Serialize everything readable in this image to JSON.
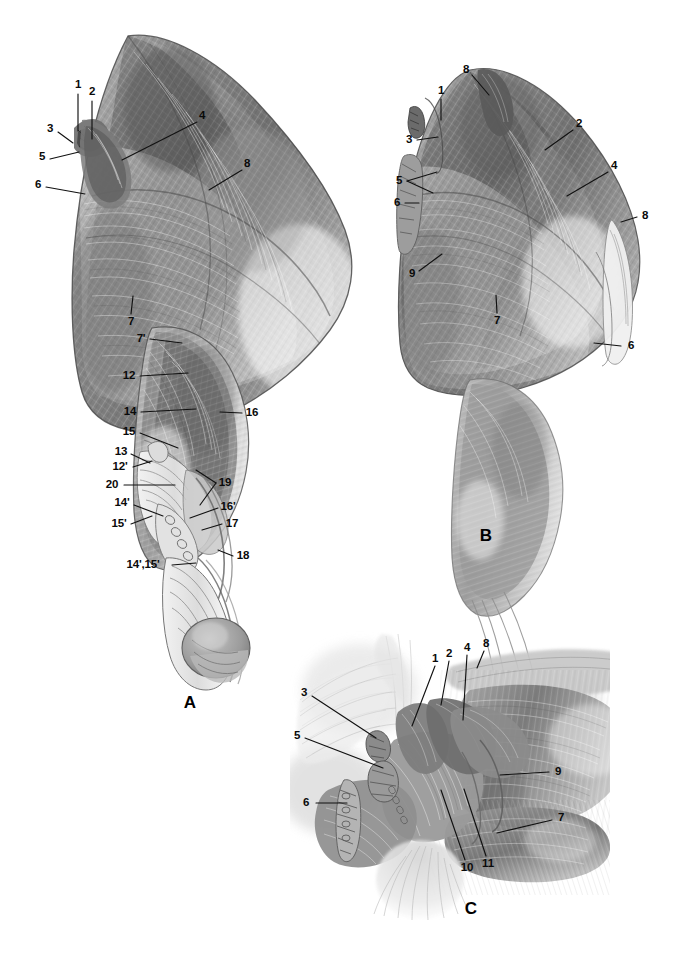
{
  "plate": {
    "background_color": "#ffffff",
    "ink_color": "#0a0a0a",
    "width": 678,
    "height": 963,
    "style": "grayscale pencil anatomical illustration"
  },
  "panels": [
    {
      "id": "A",
      "letter": "A",
      "letter_pos": [
        190,
        703
      ],
      "labels": [
        {
          "text": "1",
          "x": 78,
          "y": 85,
          "lx1": 78,
          "ly1": 94,
          "lx2": 78,
          "ly2": 131
        },
        {
          "text": "2",
          "x": 92,
          "y": 92,
          "lx1": 92,
          "ly1": 101,
          "lx2": 92,
          "ly2": 139
        },
        {
          "text": "3",
          "x": 50,
          "y": 129,
          "lx1": 58,
          "ly1": 132,
          "lx2": 73,
          "ly2": 143
        },
        {
          "text": "5",
          "x": 42,
          "y": 157,
          "lx1": 50,
          "ly1": 159,
          "lx2": 79,
          "ly2": 152
        },
        {
          "text": "6",
          "x": 38,
          "y": 185,
          "lx1": 46,
          "ly1": 187,
          "lx2": 85,
          "ly2": 194
        },
        {
          "text": "4",
          "x": 202,
          "y": 116,
          "lx1": 197,
          "ly1": 122,
          "lx2": 122,
          "ly2": 160
        },
        {
          "text": "8",
          "x": 247,
          "y": 164,
          "lx1": 242,
          "ly1": 170,
          "lx2": 209,
          "ly2": 190
        },
        {
          "text": "7",
          "x": 131,
          "y": 322,
          "lx1": 131,
          "ly1": 314,
          "lx2": 133,
          "ly2": 296
        },
        {
          "text": "7'",
          "x": 141,
          "y": 339,
          "lx1": 150,
          "ly1": 339,
          "lx2": 182,
          "ly2": 343
        },
        {
          "text": "12",
          "x": 129,
          "y": 376,
          "lx1": 140,
          "ly1": 376,
          "lx2": 188,
          "ly2": 373
        },
        {
          "text": "14",
          "x": 130,
          "y": 412,
          "lx1": 141,
          "ly1": 412,
          "lx2": 196,
          "ly2": 409
        },
        {
          "text": "15",
          "x": 129,
          "y": 432,
          "lx1": 140,
          "ly1": 433,
          "lx2": 178,
          "ly2": 448
        },
        {
          "text": "16",
          "x": 252,
          "y": 413,
          "lx1": 242,
          "ly1": 413,
          "lx2": 220,
          "ly2": 412
        },
        {
          "text": "13",
          "x": 121,
          "y": 452,
          "lx1": 131,
          "ly1": 454,
          "lx2": 150,
          "ly2": 463
        },
        {
          "text": "12'",
          "x": 120,
          "y": 467,
          "lx1": 133,
          "ly1": 467,
          "lx2": 152,
          "ly2": 461
        },
        {
          "text": "20",
          "x": 112,
          "y": 485,
          "lx1": 124,
          "ly1": 485,
          "lx2": 175,
          "ly2": 485
        },
        {
          "text": "14'",
          "x": 122,
          "y": 503,
          "lx1": 134,
          "ly1": 505,
          "lx2": 163,
          "ly2": 516
        },
        {
          "text": "15'",
          "x": 119,
          "y": 524,
          "lx1": 131,
          "ly1": 524,
          "lx2": 152,
          "ly2": 516
        },
        {
          "text": "19",
          "x": 225,
          "y": 483,
          "lx1": 216,
          "ly1": 483,
          "lx2": 196,
          "ly2": 470
        },
        {
          "text": "16'",
          "x": 228,
          "y": 507,
          "lx1": 218,
          "ly1": 508,
          "lx2": 190,
          "ly2": 518
        },
        {
          "text": "17",
          "x": 232,
          "y": 524,
          "lx1": 222,
          "ly1": 524,
          "lx2": 202,
          "ly2": 530
        },
        {
          "text": "18",
          "x": 243,
          "y": 556,
          "lx1": 233,
          "ly1": 556,
          "lx2": 218,
          "ly2": 550
        },
        {
          "text": "14',15'",
          "x": 143,
          "y": 565,
          "lx1": 172,
          "ly1": 565,
          "lx2": 196,
          "ly2": 563
        }
      ],
      "extra_leaders": [
        {
          "lx1": 216,
          "ly1": 483,
          "lx2": 200,
          "ly2": 505
        }
      ]
    },
    {
      "id": "B",
      "letter": "B",
      "letter_pos": [
        486,
        536
      ],
      "labels": [
        {
          "text": "8",
          "x": 466,
          "y": 70,
          "lx1": 472,
          "ly1": 75,
          "lx2": 489,
          "ly2": 95
        },
        {
          "text": "1",
          "x": 441,
          "y": 91,
          "lx1": 441,
          "ly1": 99,
          "lx2": 441,
          "ly2": 120
        },
        {
          "text": "3",
          "x": 409,
          "y": 140,
          "lx1": 417,
          "ly1": 140,
          "lx2": 438,
          "ly2": 137
        },
        {
          "text": "5",
          "x": 399,
          "y": 181,
          "lx1": 407,
          "ly1": 181,
          "lx2": 437,
          "ly2": 172
        },
        {
          "text": "6",
          "x": 397,
          "y": 203,
          "lx1": 405,
          "ly1": 203,
          "lx2": 419,
          "ly2": 203
        },
        {
          "text": "9",
          "x": 412,
          "y": 274,
          "lx1": 419,
          "ly1": 271,
          "lx2": 442,
          "ly2": 254
        },
        {
          "text": "7",
          "x": 497,
          "y": 321,
          "lx1": 497,
          "ly1": 313,
          "lx2": 496,
          "ly2": 295
        },
        {
          "text": "2",
          "x": 579,
          "y": 124,
          "lx1": 573,
          "ly1": 130,
          "lx2": 545,
          "ly2": 150
        },
        {
          "text": "4",
          "x": 614,
          "y": 166,
          "lx1": 608,
          "ly1": 172,
          "lx2": 567,
          "ly2": 196
        },
        {
          "text": "8",
          "x": 645,
          "y": 216,
          "lx1": 637,
          "ly1": 217,
          "lx2": 621,
          "ly2": 222
        },
        {
          "text": "6",
          "x": 631,
          "y": 346,
          "lx1": 621,
          "ly1": 346,
          "lx2": 594,
          "ly2": 343
        }
      ],
      "extra_leaders": [
        {
          "lx1": 407,
          "ly1": 181,
          "lx2": 433,
          "ly2": 193
        }
      ]
    },
    {
      "id": "C",
      "letter": "C",
      "letter_pos": [
        471,
        909
      ],
      "labels": [
        {
          "text": "3",
          "x": 304,
          "y": 693,
          "lx1": 312,
          "ly1": 696,
          "lx2": 376,
          "ly2": 738
        },
        {
          "text": "5",
          "x": 297,
          "y": 736,
          "lx1": 305,
          "ly1": 738,
          "lx2": 383,
          "ly2": 768
        },
        {
          "text": "6",
          "x": 306,
          "y": 803,
          "lx1": 316,
          "ly1": 803,
          "lx2": 347,
          "ly2": 803
        },
        {
          "text": "1",
          "x": 435,
          "y": 659,
          "lx1": 435,
          "ly1": 666,
          "lx2": 412,
          "ly2": 726
        },
        {
          "text": "2",
          "x": 449,
          "y": 654,
          "lx1": 449,
          "ly1": 661,
          "lx2": 441,
          "ly2": 705
        },
        {
          "text": "4",
          "x": 467,
          "y": 648,
          "lx1": 467,
          "ly1": 655,
          "lx2": 463,
          "ly2": 720
        },
        {
          "text": "8",
          "x": 486,
          "y": 644,
          "lx1": 484,
          "ly1": 651,
          "lx2": 477,
          "ly2": 668
        },
        {
          "text": "9",
          "x": 558,
          "y": 772,
          "lx1": 549,
          "ly1": 772,
          "lx2": 500,
          "ly2": 775
        },
        {
          "text": "7",
          "x": 561,
          "y": 818,
          "lx1": 552,
          "ly1": 820,
          "lx2": 497,
          "ly2": 833
        },
        {
          "text": "10",
          "x": 467,
          "y": 868,
          "lx1": 465,
          "ly1": 860,
          "lx2": 441,
          "ly2": 790
        },
        {
          "text": "11",
          "x": 488,
          "y": 864,
          "lx1": 486,
          "ly1": 856,
          "lx2": 464,
          "ly2": 789
        }
      ],
      "extra_leaders": []
    }
  ]
}
